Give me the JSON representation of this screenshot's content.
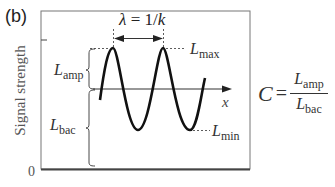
{
  "panel_label": "(b)",
  "y_axis": {
    "label": "Signal strength",
    "zero_label": "0"
  },
  "x_axis": {
    "label": "x"
  },
  "wavelength": {
    "symbol": "λ",
    "equals": " = 1/",
    "k": "k"
  },
  "labels": {
    "L_max": {
      "main": "L",
      "sub": "max"
    },
    "L_min": {
      "main": "L",
      "sub": "min"
    },
    "L_amp": {
      "main": "L",
      "sub": "amp"
    },
    "L_bac": {
      "main": "L",
      "sub": "bac"
    }
  },
  "formula": {
    "lhs": "C",
    "equals": "=",
    "numerator": {
      "main": "L",
      "sub": "amp"
    },
    "denominator": {
      "main": "L",
      "sub": "bac"
    }
  },
  "colors": {
    "curve": "#111111",
    "axis": "#333333",
    "frame": "#666666",
    "text": "#333333"
  }
}
